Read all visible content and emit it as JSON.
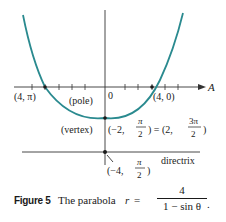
{
  "figure": {
    "curve_color": "#2a8a8f",
    "axis_color": "#333333",
    "axis_label": "A",
    "pole_zero_label": "0",
    "pole_label": "(pole)",
    "points": {
      "left_intercept": "(4, π)",
      "right_intercept": "(4, 0)",
      "vertex_label": "(vertex)",
      "vertex_coord_left": "(−2, ",
      "vertex_pi": "π",
      "vertex_den": "2",
      "vertex_mid": ") = (2, ",
      "vertex_3pi": "3π",
      "vertex_den2": "2",
      "vertex_close": ")",
      "directrix_point_left": "(−4, ",
      "directrix_pi": "π",
      "directrix_den": "2",
      "directrix_close": ")"
    },
    "directrix_label": "directrix"
  },
  "caption": {
    "label": "Figure 5",
    "text": "The parabola",
    "variable": "r",
    "equals": "=",
    "numerator": "4",
    "denominator": "1 − sin θ",
    "period": "."
  }
}
